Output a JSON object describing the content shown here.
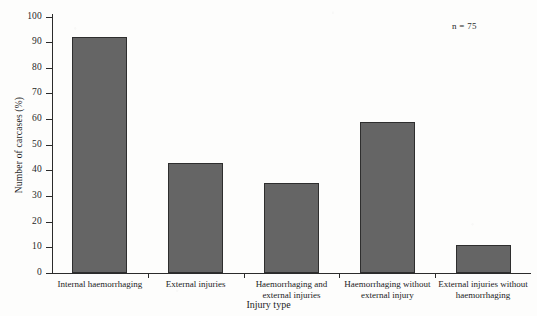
{
  "figure": {
    "annotation": "n = 75",
    "bar_color": "#656565",
    "bar_edge_color": "#2e2e2e",
    "axis_color": "#2b2b2b",
    "background_color": "#fdfdfc"
  },
  "chart_data": {
    "type": "bar",
    "title": "",
    "subtitle": "",
    "xlabel": "Injury type",
    "ylabel": "Number of carcases (%)",
    "categories": [
      "Internal haemorrhaging",
      "External injuries",
      "Haemorrhaging and external injuries",
      "Haemorrhaging without external injury",
      "External injuries without haemorrhaging"
    ],
    "category_lines": [
      [
        "Internal haemorrhaging"
      ],
      [
        "External injuries"
      ],
      [
        "Haemorrhaging and",
        "external injuries"
      ],
      [
        "Haemorrhaging without",
        "external injury"
      ],
      [
        "External injuries without",
        "haemorrhaging"
      ]
    ],
    "values": [
      92,
      43,
      35,
      59,
      11
    ],
    "ylim": [
      0,
      100
    ],
    "yticks": [
      0,
      10,
      20,
      30,
      40,
      50,
      60,
      70,
      80,
      90,
      100
    ],
    "ytick_labels": [
      "0",
      "10",
      "20",
      "30",
      "40",
      "50",
      "60",
      "70",
      "80",
      "90",
      "100"
    ],
    "grid": false,
    "legend": false,
    "annotations": [
      {
        "text": "n = 75",
        "position": "top-right"
      }
    ]
  }
}
